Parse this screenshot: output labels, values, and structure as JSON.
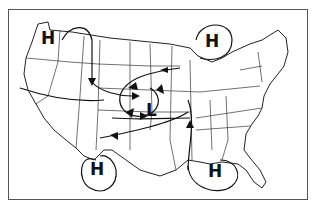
{
  "map": {
    "title": "",
    "region": "Contiguous United States",
    "systems": [
      {
        "type": "high",
        "label": "H",
        "position": "northwest"
      },
      {
        "type": "high",
        "label": "H",
        "position": "great-lakes"
      },
      {
        "type": "low",
        "label": "L",
        "position": "central"
      },
      {
        "type": "high",
        "label": "H",
        "position": "southwest-mexico"
      },
      {
        "type": "high",
        "label": "H",
        "position": "gulf-of-mexico"
      }
    ],
    "colors": {
      "lines": "#111111",
      "border": "#555555",
      "background": "#ffffff"
    }
  }
}
